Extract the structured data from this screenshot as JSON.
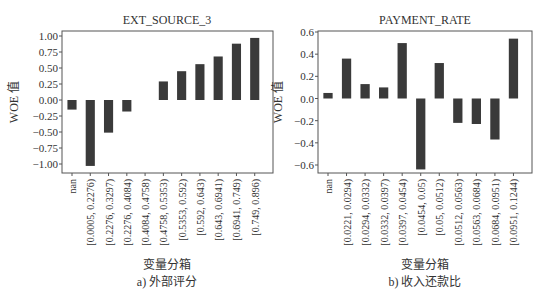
{
  "chart_data": [
    {
      "type": "bar",
      "title": "EXT_SOURCE_3",
      "xlabel": "变量分箱",
      "ylabel": "WOE 值",
      "caption": "a) 外部评分",
      "ylim": [
        -1.1,
        1.05
      ],
      "yticks": [
        1.0,
        0.75,
        0.5,
        0.25,
        0.0,
        -0.25,
        -0.5,
        -0.75,
        -1.0
      ],
      "ytick_labels": [
        "1.00",
        "0.75",
        "0.50",
        "0.25",
        "0.00",
        "−0.25",
        "−0.50",
        "−0.75",
        "−1.00"
      ],
      "categories": [
        "nan",
        "[0.0005, 0.2276)",
        "[0.2276, 0.3297)",
        "[0.2276, 0.4084)",
        "[0.4084, 0.4758)",
        "[0.4758, 0.5353)",
        "[0.5353, 0.592)",
        "[0.592, 0.643)",
        "[0.643, 0.6941)",
        "[0.6941, 0.749)",
        "[0.749, 0.896)"
      ],
      "values": [
        -0.15,
        -1.03,
        -0.51,
        -0.18,
        0.29,
        0.45,
        0.56,
        0.68,
        0.88,
        0.97,
        null
      ],
      "bar_slots": [
        -0.15,
        -1.03,
        -0.51,
        -0.18,
        null,
        0.29,
        0.45,
        0.56,
        0.68,
        0.88,
        0.97
      ],
      "bar_color": "#3a3a3a",
      "grid": false
    },
    {
      "type": "bar",
      "title": "PAYMENT_RATE",
      "xlabel": "变量分箱",
      "ylabel": "WOE 值",
      "caption": "b) 收入还款比",
      "ylim": [
        -0.66,
        0.6
      ],
      "yticks": [
        0.6,
        0.4,
        0.2,
        0.0,
        -0.2,
        -0.4,
        -0.6
      ],
      "ytick_labels": [
        "0.6",
        "0.4",
        "0.2",
        "0.0",
        "−0.2",
        "−0.4",
        "−0.6"
      ],
      "categories": [
        "nan",
        "[0.0221, 0.0294)",
        "[0.0294, 0.0332)",
        "[0.0332, 0.0397)",
        "[0.0397, 0.0454)",
        "[0.0454, 0.05)",
        "[0.05, 0.0512)",
        "[0.0512, 0.0563)",
        "[0.0563, 0.0684)",
        "[0.0684, 0.0951)",
        "[0.0951, 0.1244)"
      ],
      "values": [
        0.05,
        0.36,
        0.13,
        0.1,
        0.5,
        -0.64,
        0.32,
        -0.22,
        -0.23,
        -0.37,
        0.54
      ],
      "bar_color": "#3a3a3a",
      "grid": false
    }
  ]
}
